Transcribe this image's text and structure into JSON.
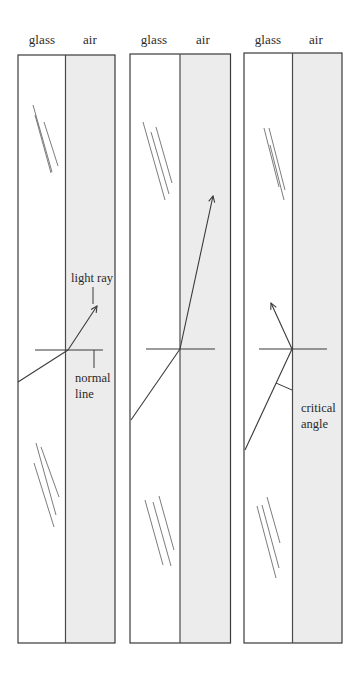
{
  "diagram": {
    "colors": {
      "glass_fill": "#ffffff",
      "air_fill": "#ececec",
      "stroke": "#3a3a3a"
    },
    "panels": [
      {
        "id": "panel-1",
        "glass_label": "glass",
        "air_label": "air",
        "description": "Light ray refracts away from the normal into air",
        "annotations": {
          "light_ray": "light ray",
          "normal_line_1": "normal",
          "normal_line_2": "line"
        }
      },
      {
        "id": "panel-2",
        "glass_label": "glass",
        "air_label": "air",
        "description": "Larger incidence angle, ray refracts close to the boundary"
      },
      {
        "id": "panel-3",
        "glass_label": "glass",
        "air_label": "air",
        "description": "At the critical angle the ray is reflected back into glass",
        "annotations": {
          "critical_angle_1": "critical",
          "critical_angle_2": "angle"
        }
      }
    ]
  }
}
